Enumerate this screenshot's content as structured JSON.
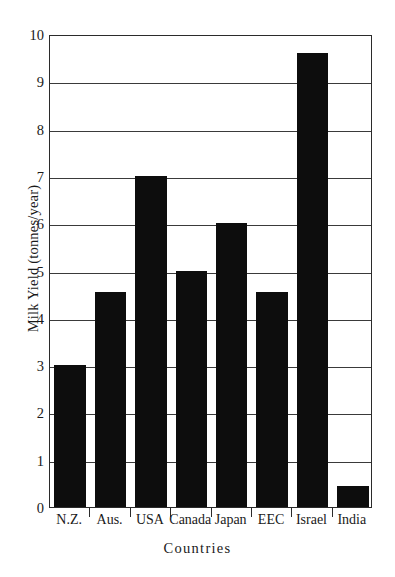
{
  "chart_data": {
    "type": "bar",
    "title": "",
    "xlabel": "Countries",
    "ylabel": "Milk Yield  (tonnes/year)",
    "categories": [
      "N.Z.",
      "Aus.",
      "USA",
      "Canada",
      "Japan",
      "EEC",
      "Israel",
      "India"
    ],
    "values": [
      3.0,
      4.55,
      7.0,
      5.0,
      6.0,
      4.55,
      9.6,
      0.45
    ],
    "ylim": [
      0,
      10
    ],
    "ytick_labels": [
      "0",
      "1",
      "2",
      "3",
      "4",
      "5",
      "6",
      "7",
      "8",
      "9",
      "10"
    ],
    "ytick_values": [
      0,
      1,
      2,
      3,
      4,
      5,
      6,
      7,
      8,
      9,
      10
    ],
    "grid": true,
    "grid_axis": "y",
    "legend": "none",
    "bar_color": "#0d0d0d",
    "axis_color": "#2b2b2b",
    "background": "#ffffff"
  }
}
